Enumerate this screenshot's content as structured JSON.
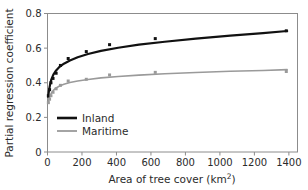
{
  "chart_data": {
    "type": "line",
    "title": "",
    "xlabel": "Area of tree cover (km²)",
    "ylabel": "Partial regression coefficient",
    "xlim": [
      0,
      1450
    ],
    "ylim": [
      0,
      0.8
    ],
    "xticks": [
      0,
      200,
      400,
      600,
      800,
      1000,
      1200,
      1400
    ],
    "xtick_labels": [
      "0",
      "200",
      "400",
      "600",
      "800",
      "1000",
      "1200",
      "1400"
    ],
    "yticks": [
      0,
      0.2,
      0.4,
      0.6,
      0.8
    ],
    "ytick_labels": [
      "0",
      "0.2",
      "0.4",
      "0.6",
      "0.8"
    ],
    "grid": false,
    "legend_position": "lower-left-inside",
    "series": [
      {
        "name": "Inland",
        "color": "#111111",
        "line_width": 2.2,
        "marker": "square",
        "marker_size": 3.0,
        "x": [
          5,
          12,
          20,
          32,
          50,
          75,
          120,
          225,
          360,
          625,
          1385
        ],
        "y": [
          0.325,
          0.36,
          0.4,
          0.425,
          0.455,
          0.5,
          0.54,
          0.58,
          0.62,
          0.655,
          0.7
        ]
      },
      {
        "name": "Maritime",
        "color": "#9a9a9a",
        "line_width": 1.6,
        "marker": "square",
        "marker_size": 3.0,
        "x": [
          5,
          12,
          20,
          32,
          50,
          75,
          120,
          225,
          360,
          625,
          1385
        ],
        "y": [
          0.285,
          0.305,
          0.325,
          0.345,
          0.365,
          0.385,
          0.41,
          0.42,
          0.445,
          0.46,
          0.465
        ]
      }
    ],
    "fit_curves": [
      {
        "name": "Inland",
        "color": "#111111",
        "line_width": 2.2,
        "points_x": [
          4,
          8,
          14,
          22,
          34,
          50,
          70,
          95,
          130,
          175,
          235,
          310,
          410,
          530,
          680,
          860,
          1060,
          1250,
          1390
        ],
        "points_y": [
          0.318,
          0.352,
          0.385,
          0.418,
          0.447,
          0.471,
          0.492,
          0.51,
          0.528,
          0.547,
          0.566,
          0.584,
          0.602,
          0.62,
          0.637,
          0.655,
          0.672,
          0.687,
          0.699
        ]
      },
      {
        "name": "Maritime",
        "color": "#9a9a9a",
        "line_width": 1.6,
        "points_x": [
          4,
          8,
          14,
          22,
          34,
          50,
          70,
          95,
          130,
          175,
          235,
          310,
          410,
          530,
          680,
          860,
          1060,
          1250,
          1390
        ],
        "points_y": [
          0.283,
          0.303,
          0.322,
          0.34,
          0.356,
          0.37,
          0.381,
          0.391,
          0.401,
          0.41,
          0.419,
          0.428,
          0.436,
          0.444,
          0.452,
          0.459,
          0.466,
          0.471,
          0.476
        ]
      }
    ],
    "legend": [
      {
        "label": "Inland",
        "color": "#111111",
        "line_width": 2.6
      },
      {
        "label": "Maritime",
        "color": "#9a9a9a",
        "line_width": 1.8
      }
    ]
  },
  "axes": {
    "frame_color": "#8c8c8c"
  }
}
